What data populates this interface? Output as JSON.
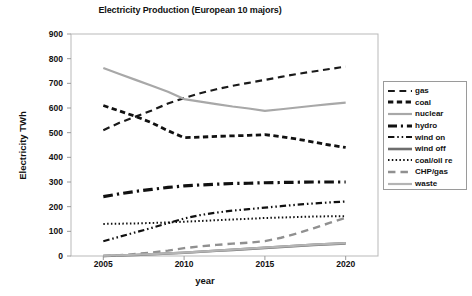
{
  "chart_data": {
    "type": "line",
    "title": "Electricity Production (European 10 majors)",
    "xlabel": "year",
    "ylabel": "Electricity TWh",
    "grid": false,
    "legend_position": "right",
    "xlim": [
      2003,
      2022
    ],
    "ylim": [
      0,
      900
    ],
    "ytick_labels": [
      "900",
      "800",
      "700",
      "600",
      "500",
      "400",
      "300",
      "200",
      "100",
      "0"
    ],
    "ytick_values": [
      900,
      800,
      700,
      600,
      500,
      400,
      300,
      200,
      100,
      0
    ],
    "xtick_labels": [
      "2005",
      "2010",
      "2015",
      "2020"
    ],
    "xtick_values": [
      2005,
      2010,
      2015,
      2020
    ],
    "x": [
      2005,
      2006,
      2007,
      2008,
      2009,
      2010,
      2011,
      2012,
      2013,
      2014,
      2015,
      2016,
      2017,
      2018,
      2019,
      2020
    ],
    "series": [
      {
        "name": "gas",
        "style": "long-dash",
        "color": "#1a1a1a",
        "width": 2.2,
        "values": [
          510,
          540,
          565,
          590,
          618,
          640,
          660,
          676,
          690,
          702,
          714,
          726,
          738,
          748,
          758,
          768
        ]
      },
      {
        "name": "coal",
        "style": "short-dash",
        "color": "#111111",
        "width": 2.8,
        "values": [
          610,
          588,
          566,
          540,
          508,
          480,
          482,
          485,
          487,
          489,
          492,
          484,
          474,
          462,
          450,
          440
        ]
      },
      {
        "name": "nuclear",
        "style": "solid",
        "color": "#a8a8a8",
        "width": 2.2,
        "values": [
          762,
          738,
          714,
          690,
          666,
          636,
          626,
          616,
          606,
          598,
          588,
          595,
          602,
          609,
          616,
          622
        ]
      },
      {
        "name": "hydro",
        "style": "dash-dot",
        "color": "#111111",
        "width": 3.2,
        "values": [
          241,
          252,
          262,
          270,
          278,
          284,
          288,
          291,
          294,
          295,
          297,
          298,
          299,
          300,
          300,
          300
        ]
      },
      {
        "name": "wind on",
        "style": "dash-dot-dot",
        "color": "#111111",
        "width": 2.2,
        "values": [
          60,
          78,
          96,
          114,
          133,
          152,
          166,
          176,
          184,
          190,
          196,
          202,
          208,
          213,
          217,
          221
        ]
      },
      {
        "name": "wind off",
        "style": "solid",
        "color": "#6e6e6e",
        "width": 2.6,
        "values": [
          0,
          2,
          4,
          7,
          10,
          13,
          17,
          21,
          25,
          29,
          33,
          37,
          41,
          45,
          48,
          51
        ]
      },
      {
        "name": "coal/oil re",
        "style": "dotted",
        "color": "#111111",
        "width": 2.0,
        "values": [
          130,
          131,
          132,
          134,
          136,
          139,
          142,
          145,
          148,
          151,
          154,
          156,
          158,
          160,
          161,
          161
        ]
      },
      {
        "name": "CHP/gas",
        "style": "long-dash",
        "color": "#909090",
        "width": 2.4,
        "values": [
          0,
          3,
          8,
          14,
          22,
          32,
          39,
          45,
          50,
          54,
          60,
          74,
          92,
          112,
          134,
          155
        ]
      },
      {
        "name": "waste",
        "style": "solid",
        "color": "#b4b4b4",
        "width": 2.2,
        "values": [
          1,
          3,
          5,
          8,
          11,
          14,
          18,
          22,
          26,
          30,
          34,
          38,
          42,
          46,
          49,
          52
        ]
      }
    ]
  },
  "legend": {
    "items": [
      {
        "label": "gas"
      },
      {
        "label": "coal"
      },
      {
        "label": "nuclear"
      },
      {
        "label": "hydro"
      },
      {
        "label": "wind on"
      },
      {
        "label": "wind off"
      },
      {
        "label": "coal/oil re"
      },
      {
        "label": "CHP/gas"
      },
      {
        "label": "waste"
      }
    ]
  }
}
